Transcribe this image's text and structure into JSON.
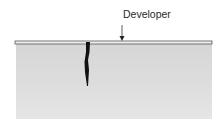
{
  "diagram": {
    "type": "penetrant-testing-cross-section",
    "labels": {
      "developer": "Developer"
    },
    "elements": {
      "specimen": "test piece cross-section",
      "developer_layer": "thin developer coating on surface",
      "crack": "surface-breaking crack filled with penetrant"
    },
    "colors": {
      "specimen": "#dcdcdc",
      "developer_layer": "#e6e6e6",
      "outline": "#555555",
      "crack": "#111111"
    }
  }
}
